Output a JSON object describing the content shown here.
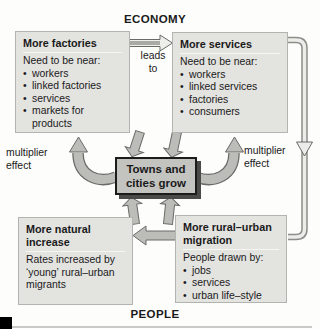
{
  "colors": {
    "background": "#fdfdfb",
    "box_fill": "#e3e3e0",
    "box_border": "#b3b3b0",
    "box_sep": "#f5f5f2",
    "center_fill": "#c3c3c0",
    "center_border": "#1c1c1a",
    "center_shadow": "#4a4a47",
    "arrow_fill": "#bcbcb9",
    "arrow_outline": "#6a6a67",
    "arrow_open_fill": "#eeeeeb",
    "arrow_shaft": "#a9a9a6",
    "pipe_outline": "#8c8c89",
    "pipe_inner": "#ecece9",
    "text": "#1a1a1a",
    "corner": "#000000",
    "rule": "#c9c9c6"
  },
  "glyphs": {
    "bullet": "•"
  },
  "labels": {
    "economy": "ECONOMY",
    "people": "PEOPLE",
    "leads_to_line1": "leads",
    "leads_to_line2": "to",
    "multiplier_left_line1": "multiplier",
    "multiplier_left_line2": "effect",
    "multiplier_right_line1": "multiplier",
    "multiplier_right_line2": "effect"
  },
  "center_box": {
    "line1": "Towns and",
    "line2": "cities grow"
  },
  "boxes": {
    "factories": {
      "title": "More factories",
      "intro": "Need to be near:",
      "bullets": [
        "workers",
        "linked factories",
        "services",
        "markets for products"
      ]
    },
    "services": {
      "title": "More services",
      "intro": "Need to be near:",
      "bullets": [
        "workers",
        "linked services",
        "factories",
        "consumers"
      ]
    },
    "natural_increase": {
      "title": "More natural increase",
      "body": "Rates increased by ‘young’ rural–urban migrants"
    },
    "migration": {
      "title": "More rural–urban migration",
      "intro": "People drawn by:",
      "bullets": [
        "jobs",
        "services",
        "urban life–style"
      ]
    }
  }
}
